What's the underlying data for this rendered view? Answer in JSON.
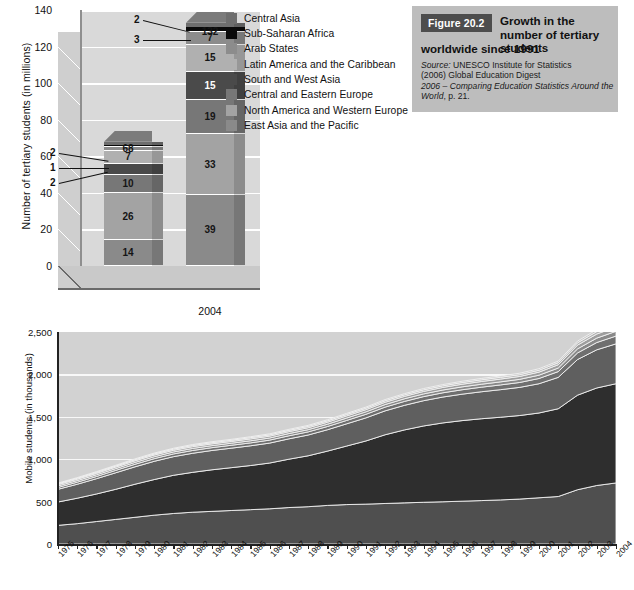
{
  "figure_box": {
    "tag": "Figure 20.2",
    "title_line1": "Growth in the number",
    "title_line2": "of tertiary students",
    "title_line3": "worldwide since 1991",
    "source_prefix": "Source:",
    "source_line1": " UNESCO Institute for Statistics",
    "source_line2": "(2006) Global Education Digest",
    "source_italic": "2006 – Comparing Education Statistics Around the World",
    "source_tail": ", p. 21.",
    "tag_bg": "#4d4d4d",
    "box_bg": "#bdbdbd"
  },
  "legend": {
    "items": [
      {
        "label": "Central Asia",
        "color": "#6e6e6e"
      },
      {
        "label": "Sub-Saharan Africa",
        "color": "#0a0a0a"
      },
      {
        "label": "Arab States",
        "color": "#8c8c8c"
      },
      {
        "label": "Latin America and the Caribbean",
        "color": "#b0b0b0"
      },
      {
        "label": "South and West Asia",
        "color": "#4a4a4a"
      },
      {
        "label": "Central and Eastern Europe",
        "color": "#777777"
      },
      {
        "label": "North America and Western Europe",
        "color": "#a3a3a3"
      },
      {
        "label": "East Asia and the Pacific",
        "color": "#8a8a8a"
      }
    ]
  },
  "chart_data": [
    {
      "id": "tertiary-students-stacked-bar",
      "type": "bar",
      "stacked": true,
      "title": "",
      "xlabel": "",
      "ylabel": "Number of tertiary students (in millions)",
      "ylim": [
        0,
        140
      ],
      "yticks": [
        0,
        20,
        40,
        60,
        80,
        100,
        120,
        140
      ],
      "grid": true,
      "categories": [
        "1991",
        "2004"
      ],
      "totals": [
        68,
        132
      ],
      "total_labels": [
        "68",
        "132"
      ],
      "series": [
        {
          "name": "East Asia and the Pacific",
          "color": "#8a8a8a",
          "values": [
            14,
            39
          ]
        },
        {
          "name": "North America and Western Europe",
          "color": "#a3a3a3",
          "values": [
            26,
            33
          ]
        },
        {
          "name": "Central and Eastern Europe",
          "color": "#777777",
          "values": [
            10,
            19
          ]
        },
        {
          "name": "South and West Asia",
          "color": "#4a4a4a",
          "values": [
            6,
            15
          ]
        },
        {
          "name": "Latin America and the Caribbean",
          "color": "#b0b0b0",
          "values": [
            7,
            15
          ]
        },
        {
          "name": "Arab States",
          "color": "#8c8c8c",
          "values": [
            2,
            7
          ]
        },
        {
          "name": "Sub-Saharan Africa",
          "color": "#0a0a0a",
          "values": [
            1,
            3
          ]
        },
        {
          "name": "Central Asia",
          "color": "#6e6e6e",
          "values": [
            2,
            2
          ]
        }
      ],
      "callouts_1991": [
        "2",
        "1",
        "2"
      ],
      "callouts_2004": [
        "2",
        "3"
      ]
    },
    {
      "id": "mobile-students-stacked-area",
      "type": "area",
      "stacked": true,
      "title": "",
      "xlabel": "",
      "ylabel": "Mobile students (in thousands)",
      "ylim": [
        0,
        2500
      ],
      "yticks": [
        0,
        500,
        1000,
        1500,
        2000,
        2500
      ],
      "grid": true,
      "x": [
        "1975",
        "1976",
        "1977",
        "1978",
        "1979",
        "1980",
        "1981",
        "1982",
        "1983",
        "1984",
        "1985",
        "1986",
        "1987",
        "1988",
        "1989",
        "1990",
        "1991",
        "1992",
        "1993",
        "1994",
        "1995",
        "1996",
        "1997",
        "1998",
        "1999",
        "2000",
        "2001",
        "2002",
        "2003",
        "2004"
      ],
      "series": [
        {
          "name": "East Asia and the Pacific",
          "color": "#4f4f4f",
          "values": [
            220,
            240,
            265,
            290,
            315,
            340,
            360,
            375,
            385,
            395,
            405,
            415,
            430,
            440,
            455,
            465,
            470,
            478,
            485,
            492,
            498,
            505,
            512,
            520,
            530,
            545,
            560,
            640,
            690,
            720
          ]
        },
        {
          "name": "North America and Western Europe",
          "color": "#2e2e2e",
          "values": [
            275,
            300,
            325,
            355,
            390,
            420,
            450,
            470,
            490,
            505,
            520,
            540,
            570,
            600,
            640,
            690,
            745,
            810,
            860,
            900,
            930,
            950,
            965,
            975,
            985,
            1000,
            1035,
            1115,
            1150,
            1170
          ]
        },
        {
          "name": "Central and Eastern Europe",
          "color": "#5f5f5f",
          "values": [
            150,
            165,
            180,
            195,
            205,
            215,
            220,
            225,
            228,
            230,
            233,
            235,
            240,
            245,
            252,
            262,
            272,
            282,
            290,
            298,
            305,
            312,
            318,
            325,
            332,
            345,
            370,
            420,
            450,
            470
          ]
        },
        {
          "name": "South and West Asia",
          "color": "#6f6f6f",
          "values": [
            22,
            24,
            26,
            28,
            30,
            31,
            32,
            33,
            33,
            34,
            34,
            35,
            36,
            37,
            38,
            40,
            42,
            44,
            46,
            48,
            50,
            52,
            54,
            56,
            58,
            62,
            68,
            78,
            86,
            92
          ]
        },
        {
          "name": "Arab States",
          "color": "#898989",
          "values": [
            18,
            19,
            20,
            21,
            22,
            23,
            23,
            24,
            24,
            24,
            25,
            25,
            26,
            26,
            27,
            28,
            29,
            30,
            31,
            32,
            33,
            34,
            35,
            36,
            37,
            39,
            42,
            48,
            52,
            56
          ]
        },
        {
          "name": "Latin America and the Caribbean",
          "color": "#9e9e9e",
          "values": [
            15,
            16,
            17,
            18,
            19,
            20,
            20,
            21,
            21,
            21,
            22,
            22,
            23,
            23,
            24,
            25,
            26,
            27,
            28,
            29,
            30,
            31,
            32,
            33,
            34,
            36,
            39,
            44,
            48,
            51
          ]
        },
        {
          "name": "Central Asia",
          "color": "#b4b4b4",
          "values": [
            10,
            11,
            11,
            12,
            13,
            13,
            14,
            14,
            14,
            14,
            15,
            15,
            15,
            16,
            16,
            17,
            17,
            18,
            18,
            19,
            19,
            20,
            20,
            21,
            21,
            22,
            24,
            27,
            29,
            31
          ]
        },
        {
          "name": "Sub-Saharan Africa",
          "color": "#c4c4c4",
          "values": [
            8,
            8,
            9,
            9,
            10,
            10,
            10,
            11,
            11,
            11,
            11,
            12,
            12,
            12,
            13,
            13,
            13,
            14,
            14,
            15,
            15,
            15,
            16,
            16,
            17,
            18,
            19,
            21,
            23,
            25
          ]
        }
      ]
    }
  ]
}
